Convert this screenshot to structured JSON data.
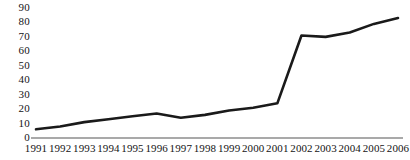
{
  "chart_data": {
    "type": "line",
    "title": "",
    "subtitle": "",
    "xlabel": "",
    "ylabel": "",
    "categories": [
      "1991",
      "1992",
      "1993",
      "1994",
      "1995",
      "1996",
      "1997",
      "1998",
      "1999",
      "2000",
      "2001",
      "2002",
      "2003",
      "2004",
      "2005",
      "2006"
    ],
    "values": [
      6,
      8,
      11,
      13,
      15,
      17,
      14,
      16,
      19,
      21,
      24,
      71,
      70,
      73,
      79,
      83
    ],
    "series": [
      {
        "name": "",
        "values": [
          6,
          8,
          11,
          13,
          15,
          17,
          14,
          16,
          19,
          21,
          24,
          71,
          70,
          73,
          79,
          83
        ]
      }
    ],
    "ylim": [
      0,
      90
    ],
    "yticks": [
      0,
      10,
      20,
      30,
      40,
      50,
      60,
      70,
      80,
      90
    ],
    "ytick_labels": [
      "0",
      "10",
      "20",
      "30",
      "40",
      "50",
      "60",
      "70",
      "80",
      "90"
    ],
    "xtick_labels": [
      "1991",
      "1992",
      "1993",
      "1994",
      "1995",
      "1996",
      "1997",
      "1998",
      "1999",
      "2000",
      "2001",
      "2002",
      "2003",
      "2004",
      "2005",
      "2006"
    ],
    "grid": false,
    "legend": false,
    "legend_position": "none",
    "annotations": [],
    "colors": {
      "line": "#1a1a1a",
      "axis": "#8c8c8c",
      "text": "#141414",
      "background": "#ffffff"
    },
    "line_width": 2.6,
    "markers": false
  }
}
